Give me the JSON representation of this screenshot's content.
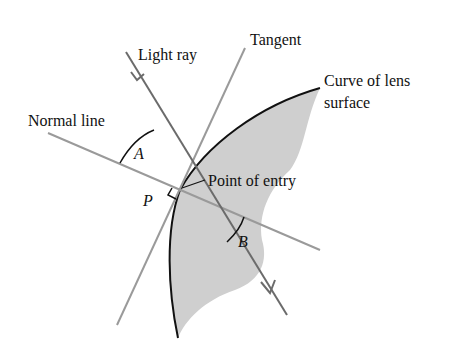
{
  "diagram": {
    "labels": {
      "light_ray": "Light ray",
      "tangent": "Tangent",
      "curve_line1": "Curve of lens",
      "curve_line2": "surface",
      "normal_line": "Normal line",
      "point_of_entry": "Point of entry",
      "angle_a": "A",
      "angle_b": "B",
      "point_p": "P"
    },
    "colors": {
      "ray": "#6b6b6b",
      "guide": "#9a9a9a",
      "curve": "#111111",
      "lens_fill": "#cfcfcf"
    }
  }
}
